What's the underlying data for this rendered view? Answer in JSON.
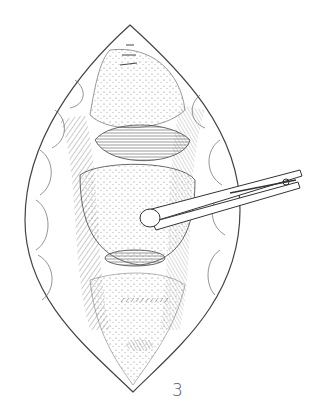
{
  "figure": {
    "label": "3",
    "colors": {
      "ink": "#333333",
      "background": "#ffffff"
    }
  }
}
